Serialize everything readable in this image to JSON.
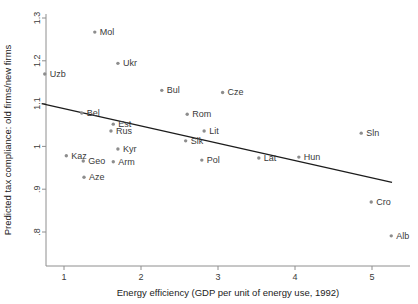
{
  "chart_data": {
    "type": "scatter",
    "title": "",
    "xlabel": "Energy efficiency (GDP per unit of energy use, 1992)",
    "ylabel": "Predicted tax compliance: old firms/new firms",
    "xlim": [
      0.68,
      5.4
    ],
    "ylim": [
      0.78,
      1.3
    ],
    "xticks": [
      1,
      2,
      3,
      4,
      5
    ],
    "xticklabels": [
      "1",
      "2",
      "3",
      "4",
      "5"
    ],
    "yticks": [
      0.8,
      0.9,
      1.0,
      1.1,
      1.2,
      1.3
    ],
    "yticklabels": [
      ".8",
      ".9",
      "1",
      "1.1",
      "1.2",
      "1.3"
    ],
    "grid": false,
    "legend": false,
    "points": [
      {
        "label": "Mol",
        "x": 1.4,
        "y": 1.267,
        "label_dx": 5,
        "label_dy": 3
      },
      {
        "label": "Ukr",
        "x": 1.7,
        "y": 1.194,
        "label_dx": 5,
        "label_dy": 3
      },
      {
        "label": "Uzb",
        "x": 0.75,
        "y": 1.169,
        "label_dx": 5,
        "label_dy": 3
      },
      {
        "label": "Bul",
        "x": 2.27,
        "y": 1.131,
        "label_dx": 5,
        "label_dy": 3
      },
      {
        "label": "Cze",
        "x": 3.06,
        "y": 1.126,
        "label_dx": 5,
        "label_dy": 3
      },
      {
        "label": "Rom",
        "x": 2.6,
        "y": 1.075,
        "label_dx": 5,
        "label_dy": 3
      },
      {
        "label": "Bel",
        "x": 1.23,
        "y": 1.078,
        "label_dx": 5,
        "label_dy": 3
      },
      {
        "label": "Lit",
        "x": 2.82,
        "y": 1.036,
        "label_dx": 5,
        "label_dy": 3
      },
      {
        "label": "Est",
        "x": 1.64,
        "y": 1.052,
        "label_dx": 5,
        "label_dy": 3
      },
      {
        "label": "Rus",
        "x": 1.61,
        "y": 1.036,
        "label_dx": 5,
        "label_dy": 3
      },
      {
        "label": "Slk",
        "x": 2.58,
        "y": 1.013,
        "label_dx": 5,
        "label_dy": 3
      },
      {
        "label": "Sln",
        "x": 4.86,
        "y": 1.031,
        "label_dx": 5,
        "label_dy": 3
      },
      {
        "label": "Kyr",
        "x": 1.7,
        "y": 0.994,
        "label_dx": 5,
        "label_dy": 3
      },
      {
        "label": "Kaz",
        "x": 1.03,
        "y": 0.978,
        "label_dx": 5,
        "label_dy": 3
      },
      {
        "label": "Geo",
        "x": 1.25,
        "y": 0.966,
        "label_dx": 5,
        "label_dy": 3
      },
      {
        "label": "Arm",
        "x": 1.64,
        "y": 0.964,
        "label_dx": 5,
        "label_dy": 3
      },
      {
        "label": "Pol",
        "x": 2.79,
        "y": 0.968,
        "label_dx": 5,
        "label_dy": 3
      },
      {
        "label": "Lat",
        "x": 3.53,
        "y": 0.973,
        "label_dx": 5,
        "label_dy": 3
      },
      {
        "label": "Hun",
        "x": 4.05,
        "y": 0.975,
        "label_dx": 5,
        "label_dy": 3
      },
      {
        "label": "Aze",
        "x": 1.26,
        "y": 0.928,
        "label_dx": 5,
        "label_dy": 3
      },
      {
        "label": "Cro",
        "x": 4.99,
        "y": 0.87,
        "label_dx": 5,
        "label_dy": 3
      },
      {
        "label": "Alb",
        "x": 5.25,
        "y": 0.791,
        "label_dx": 5,
        "label_dy": 3
      }
    ],
    "fit_line": {
      "x0": 0.71,
      "y0": 1.1,
      "x1": 5.26,
      "y1": 0.916
    }
  }
}
